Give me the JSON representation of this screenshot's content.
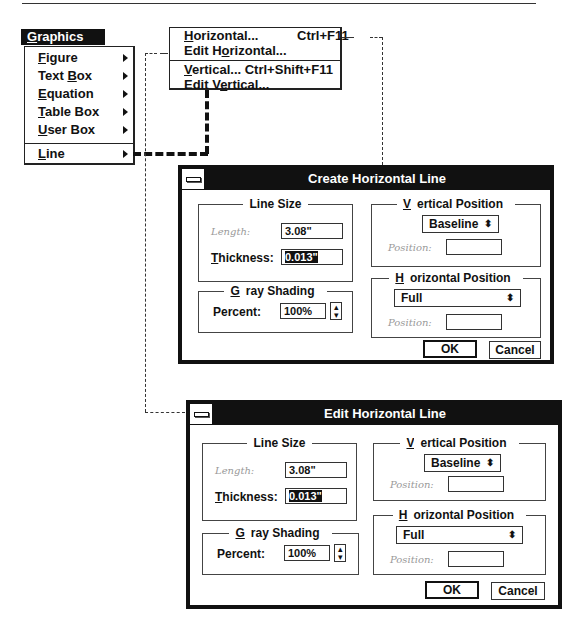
{
  "graphics_menu": {
    "title": "Graphics",
    "title_underline": "G",
    "items": [
      {
        "label_pre": "",
        "accel": "F",
        "label_post": "igure",
        "has_submenu": true
      },
      {
        "label_pre": "Text ",
        "accel": "B",
        "label_post": "ox",
        "has_submenu": true
      },
      {
        "label_pre": "",
        "accel": "E",
        "label_post": "quation",
        "has_submenu": true
      },
      {
        "label_pre": "",
        "accel": "T",
        "label_post": "able Box",
        "has_submenu": true
      },
      {
        "label_pre": "",
        "accel": "U",
        "label_post": "ser Box",
        "has_submenu": true
      },
      {
        "label_pre": "",
        "accel": "L",
        "label_post": "ine",
        "has_submenu": true
      }
    ]
  },
  "line_submenu": {
    "items": [
      {
        "label_pre": "",
        "accel": "H",
        "label_post": "orizontal...",
        "shortcut": "Ctrl+F11"
      },
      {
        "label_pre": "Edit H",
        "accel": "o",
        "label_post": "rizontal...",
        "shortcut": ""
      },
      {
        "label_pre": "",
        "accel": "V",
        "label_post": "ertical...",
        "shortcut": "Ctrl+Shift+F11"
      },
      {
        "label_pre": "Edit V",
        "accel": "e",
        "label_post": "rtical...",
        "shortcut": ""
      }
    ]
  },
  "dialogs": [
    {
      "title": "Create Horizontal Line",
      "line_size": {
        "label": "Line Size",
        "length_label": "Length:",
        "length_value": "3.08\"",
        "thickness_label_accel": "T",
        "thickness_label_rest": "hickness:",
        "thickness_value": "0.013\""
      },
      "gray_shading": {
        "label_accel": "G",
        "label_rest": "ray Shading",
        "percent_label": "Percent:",
        "percent_value": "100%"
      },
      "vertical_position": {
        "label_accel": "V",
        "label_rest": "ertical Position",
        "selected": "Baseline",
        "position_label": "Position:",
        "position_value": ""
      },
      "horizontal_position": {
        "label_accel": "H",
        "label_rest": "orizontal Position",
        "selected": "Full",
        "position_label": "Position:",
        "position_value": ""
      },
      "ok_label": "OK",
      "cancel_label": "Cancel"
    },
    {
      "title": "Edit Horizontal Line",
      "line_size": {
        "label": "Line Size",
        "length_label": "Length:",
        "length_value": "3.08\"",
        "thickness_label_accel": "T",
        "thickness_label_rest": "hickness:",
        "thickness_value": "0.013\""
      },
      "gray_shading": {
        "label_accel": "G",
        "label_rest": "ray Shading",
        "percent_label": "Percent:",
        "percent_value": "100%"
      },
      "vertical_position": {
        "label_accel": "V",
        "label_rest": "ertical Position",
        "selected": "Baseline",
        "position_label": "Position:",
        "position_value": ""
      },
      "horizontal_position": {
        "label_accel": "H",
        "label_rest": "orizontal Position",
        "selected": "Full",
        "position_label": "Position:",
        "position_value": ""
      },
      "ok_label": "OK",
      "cancel_label": "Cancel"
    }
  ],
  "glyphs": {
    "spin": "▲▼",
    "updown": "⬍"
  }
}
